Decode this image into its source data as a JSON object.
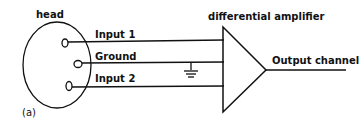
{
  "diagram": {
    "labels": {
      "head": "head",
      "input1": "Input 1",
      "ground": "Ground",
      "input2": "Input 2",
      "amplifier": "differential amplifier",
      "output": "Output channel",
      "panel": "(a)"
    },
    "colors": {
      "stroke": "#111111",
      "background": "#ffffff"
    }
  }
}
